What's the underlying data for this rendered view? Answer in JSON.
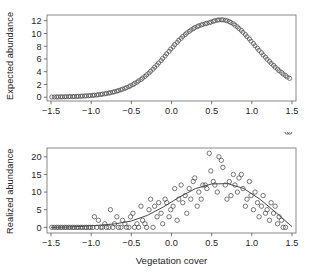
{
  "figure": {
    "background": "#ffffff",
    "point_color": "#4d4d4d",
    "curve_color": "#333333",
    "axis_color": "#6b6b6b",
    "xlabel": "Vegetation cover"
  },
  "chart_data": [
    {
      "type": "scatter",
      "panel": "top",
      "title": "",
      "xlabel": "",
      "ylabel": "Expected abundance",
      "xlim": [
        -1.55,
        1.55
      ],
      "ylim": [
        -0.6,
        12.9
      ],
      "xticks": [
        -1.5,
        -1.0,
        -0.5,
        0.0,
        0.5,
        1.0,
        1.5
      ],
      "xticklabels": [
        "−1.5",
        "−1.0",
        "−0.5",
        "0.0",
        "0.5",
        "1.0",
        "1.5"
      ],
      "yticks": [
        0,
        2,
        4,
        6,
        8,
        10,
        12
      ],
      "yticklabels": [
        "0",
        "2",
        "4",
        "6",
        "8",
        "10",
        "12"
      ],
      "grid": false,
      "legend": false,
      "marker": "open-circle",
      "x": [
        -1.49,
        -1.46,
        -1.43,
        -1.41,
        -1.38,
        -1.36,
        -1.33,
        -1.31,
        -1.28,
        -1.26,
        -1.23,
        -1.21,
        -1.18,
        -1.16,
        -1.13,
        -1.11,
        -1.08,
        -1.06,
        -1.03,
        -1.01,
        -0.98,
        -0.96,
        -0.93,
        -0.91,
        -0.88,
        -0.86,
        -0.83,
        -0.81,
        -0.78,
        -0.76,
        -0.73,
        -0.71,
        -0.68,
        -0.66,
        -0.63,
        -0.61,
        -0.58,
        -0.56,
        -0.53,
        -0.51,
        -0.48,
        -0.46,
        -0.43,
        -0.41,
        -0.38,
        -0.36,
        -0.33,
        -0.31,
        -0.28,
        -0.26,
        -0.23,
        -0.21,
        -0.18,
        -0.16,
        -0.13,
        -0.11,
        -0.08,
        -0.06,
        -0.03,
        -0.01,
        0.02,
        0.04,
        0.07,
        0.09,
        0.12,
        0.14,
        0.17,
        0.19,
        0.22,
        0.24,
        0.27,
        0.29,
        0.32,
        0.34,
        0.37,
        0.39,
        0.42,
        0.44,
        0.47,
        0.49,
        0.52,
        0.54,
        0.57,
        0.59,
        0.62,
        0.64,
        0.67,
        0.69,
        0.72,
        0.74,
        0.77,
        0.79,
        0.82,
        0.84,
        0.87,
        0.89,
        0.92,
        0.94,
        0.97,
        0.99,
        1.02,
        1.04,
        1.07,
        1.09,
        1.12,
        1.14,
        1.17,
        1.19,
        1.22,
        1.24,
        1.27,
        1.29,
        1.32,
        1.34,
        1.37,
        1.39,
        1.42,
        1.44,
        1.47
      ],
      "y": [
        0.03,
        0.03,
        0.04,
        0.04,
        0.05,
        0.05,
        0.06,
        0.07,
        0.08,
        0.09,
        0.1,
        0.11,
        0.12,
        0.14,
        0.15,
        0.17,
        0.19,
        0.21,
        0.23,
        0.26,
        0.29,
        0.32,
        0.35,
        0.39,
        0.43,
        0.48,
        0.53,
        0.58,
        0.64,
        0.71,
        0.78,
        0.86,
        0.95,
        1.04,
        1.15,
        1.26,
        1.38,
        1.51,
        1.65,
        1.81,
        1.97,
        2.15,
        2.34,
        2.55,
        2.77,
        3.0,
        3.25,
        3.51,
        3.79,
        4.08,
        4.39,
        4.71,
        5.04,
        5.38,
        5.73,
        6.09,
        6.45,
        6.82,
        7.19,
        7.55,
        7.91,
        8.26,
        8.6,
        8.93,
        9.24,
        9.54,
        9.82,
        10.08,
        10.32,
        10.54,
        10.74,
        10.92,
        11.08,
        11.21,
        11.33,
        11.43,
        11.52,
        11.6,
        11.69,
        11.79,
        11.9,
        12.0,
        12.08,
        12.13,
        12.15,
        12.13,
        12.08,
        11.99,
        11.87,
        11.71,
        11.52,
        11.3,
        11.05,
        10.78,
        10.48,
        10.17,
        9.84,
        9.5,
        9.15,
        8.79,
        8.43,
        8.07,
        7.7,
        7.34,
        6.98,
        6.63,
        6.28,
        5.95,
        5.62,
        5.3,
        5.0,
        4.7,
        4.42,
        4.15,
        3.89,
        3.64,
        3.4,
        3.17,
        2.96,
        2.75,
        2.56,
        1.95
      ]
    },
    {
      "type": "scatter",
      "panel": "bottom",
      "title": "",
      "xlabel": "Vegetation cover",
      "ylabel": "Realized abundance",
      "xlim": [
        -1.55,
        1.55
      ],
      "ylim": [
        -1.6,
        22.5
      ],
      "xticks": [
        -1.5,
        -1.0,
        -0.5,
        0.0,
        0.5,
        1.0,
        1.5
      ],
      "xticklabels": [
        "−1.5",
        "−1.0",
        "−0.5",
        "0.0",
        "0.5",
        "1.0",
        "1.5"
      ],
      "yticks": [
        0,
        5,
        10,
        15,
        20
      ],
      "yticklabels": [
        "0",
        "5",
        "10",
        "15",
        "20"
      ],
      "grid": false,
      "legend": false,
      "marker": "open-circle",
      "x": [
        -1.49,
        -1.46,
        -1.43,
        -1.41,
        -1.38,
        -1.36,
        -1.33,
        -1.31,
        -1.28,
        -1.26,
        -1.23,
        -1.21,
        -1.18,
        -1.16,
        -1.13,
        -1.11,
        -1.08,
        -1.06,
        -1.03,
        -1.01,
        -0.98,
        -0.96,
        -0.93,
        -0.91,
        -0.88,
        -0.86,
        -0.83,
        -0.81,
        -0.78,
        -0.76,
        -0.73,
        -0.71,
        -0.68,
        -0.66,
        -0.63,
        -0.61,
        -0.58,
        -0.56,
        -0.53,
        -0.51,
        -0.48,
        -0.46,
        -0.43,
        -0.41,
        -0.38,
        -0.36,
        -0.33,
        -0.31,
        -0.28,
        -0.26,
        -0.23,
        -0.21,
        -0.18,
        -0.16,
        -0.13,
        -0.11,
        -0.08,
        -0.06,
        -0.03,
        -0.01,
        0.02,
        0.04,
        0.07,
        0.09,
        0.12,
        0.14,
        0.17,
        0.19,
        0.22,
        0.24,
        0.27,
        0.29,
        0.32,
        0.34,
        0.37,
        0.39,
        0.42,
        0.44,
        0.47,
        0.49,
        0.52,
        0.54,
        0.57,
        0.59,
        0.62,
        0.64,
        0.67,
        0.69,
        0.72,
        0.74,
        0.77,
        0.79,
        0.82,
        0.84,
        0.87,
        0.89,
        0.92,
        0.94,
        0.97,
        0.99,
        1.02,
        1.04,
        1.07,
        1.09,
        1.12,
        1.14,
        1.17,
        1.19,
        1.22,
        1.24,
        1.27,
        1.29,
        1.32,
        1.34,
        1.37,
        1.39,
        1.42,
        1.44,
        1.47
      ],
      "y": [
        0,
        0,
        0,
        0,
        0,
        0,
        0,
        0,
        0,
        0,
        0,
        0,
        0,
        0,
        0,
        0,
        0,
        0,
        0,
        0,
        0,
        3,
        0,
        2,
        0,
        0,
        1,
        0,
        0,
        5,
        0,
        1,
        3,
        0,
        0,
        2,
        1,
        0,
        0,
        3,
        4,
        0,
        1,
        0,
        6,
        2,
        1,
        0,
        5,
        8,
        0,
        6,
        3,
        7,
        4,
        1,
        8,
        7,
        3,
        5,
        6,
        11,
        2,
        8,
        12,
        7,
        9,
        4,
        11,
        8,
        13,
        14,
        6,
        10,
        8,
        12,
        12,
        11,
        21,
        16,
        13,
        12,
        10,
        20,
        19,
        17,
        12,
        8,
        13,
        9,
        15,
        12,
        10,
        14,
        15,
        11,
        6,
        8,
        13,
        9,
        5,
        10,
        7,
        3,
        6,
        9,
        4,
        5,
        2,
        7,
        4,
        6,
        1,
        3,
        2,
        0,
        0
      ],
      "fit_curve_note": "smooth fitted curve peaking near 12.5 at x ~ 0.6",
      "fit_x": [
        -1.5,
        -1.3,
        -1.1,
        -0.9,
        -0.7,
        -0.5,
        -0.3,
        -0.1,
        0.1,
        0.3,
        0.5,
        0.7,
        0.9,
        1.1,
        1.3,
        1.5
      ],
      "fit_y": [
        0.0,
        0.1,
        0.3,
        0.6,
        1.0,
        1.8,
        3.4,
        5.8,
        8.6,
        11.0,
        12.3,
        12.4,
        11.0,
        8.0,
        4.2,
        0.2
      ]
    }
  ]
}
